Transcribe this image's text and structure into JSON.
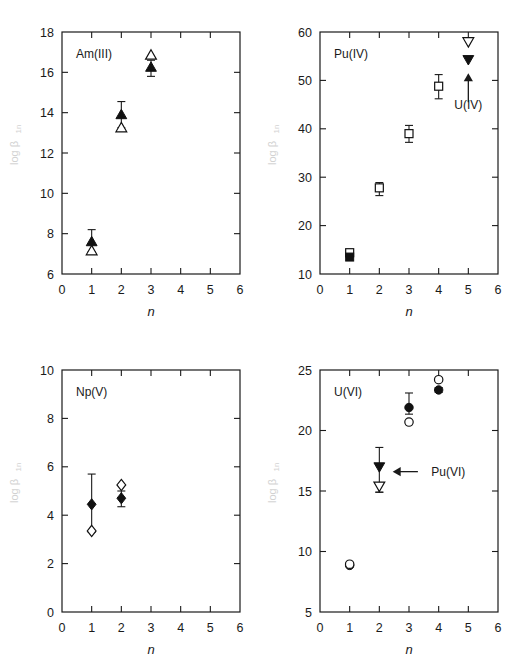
{
  "figure": {
    "cutoff_header": "",
    "axis": {
      "xlabel": "n",
      "ylabel_main": "log",
      "ylabel_beta": "β",
      "ylabel_sub": "1n"
    }
  },
  "chart_data": [
    {
      "type": "scatter",
      "panel": "top-left",
      "title": "Am(III)",
      "xlabel": "n",
      "ylabel": "log β 1n",
      "xlim": [
        0,
        6
      ],
      "ylim": [
        6,
        18
      ],
      "xticks": [
        0,
        1,
        2,
        3,
        4,
        5,
        6
      ],
      "yticks": [
        6,
        8,
        10,
        12,
        14,
        16,
        18
      ],
      "grid": false,
      "legend": "none",
      "series": [
        {
          "name": "filled-triangle-up",
          "marker": "triangle-up-filled",
          "x": [
            1,
            2,
            3
          ],
          "values": [
            7.6,
            13.9,
            16.25
          ],
          "yerr_low": [
            0.5,
            0.65,
            0.45
          ],
          "yerr_high": [
            0.6,
            0.65,
            0.35
          ]
        },
        {
          "name": "open-triangle-up",
          "marker": "triangle-up-open",
          "x": [
            1,
            2,
            3
          ],
          "values": [
            7.15,
            13.25,
            16.85
          ],
          "yerr_low": [
            0,
            0,
            0
          ],
          "yerr_high": [
            0,
            0,
            0
          ]
        }
      ],
      "annotations": []
    },
    {
      "type": "scatter",
      "panel": "top-right",
      "title": "Pu(IV)",
      "xlabel": "n",
      "ylabel": "log β 1n",
      "xlim": [
        0,
        6
      ],
      "ylim": [
        10,
        60
      ],
      "xticks": [
        0,
        1,
        2,
        3,
        4,
        5,
        6
      ],
      "yticks": [
        10,
        20,
        30,
        40,
        50,
        60
      ],
      "grid": false,
      "legend": "none",
      "series": [
        {
          "name": "open-square",
          "marker": "square-open",
          "x": [
            1,
            2,
            3,
            4
          ],
          "values": [
            14.4,
            27.8,
            39.0,
            48.8
          ],
          "yerr_low": [
            0.9,
            1.6,
            1.8,
            2.6
          ],
          "yerr_high": [
            0.6,
            1.1,
            1.7,
            2.4
          ]
        },
        {
          "name": "filled-square",
          "marker": "square-filled",
          "x": [
            1
          ],
          "values": [
            13.5
          ],
          "yerr_low": [
            0
          ],
          "yerr_high": [
            0
          ]
        },
        {
          "name": "open-triangle-down",
          "marker": "triangle-down-open",
          "x": [
            5
          ],
          "values": [
            58.0
          ],
          "yerr_low": [
            0
          ],
          "yerr_high": [
            0
          ]
        },
        {
          "name": "filled-triangle-down",
          "marker": "triangle-down-filled",
          "x": [
            5
          ],
          "values": [
            54.3
          ],
          "yerr_low": [
            0
          ],
          "yerr_high": [
            0
          ]
        }
      ],
      "annotations": [
        {
          "label": "U(IV)",
          "x": 5,
          "y": 45.0,
          "arrow": "up",
          "arrow_from_y": 45.5,
          "arrow_to_y": 51.5
        }
      ]
    },
    {
      "type": "scatter",
      "panel": "bottom-left",
      "title": "Np(V)",
      "xlabel": "n",
      "ylabel": "log β 1n",
      "xlim": [
        0,
        6
      ],
      "ylim": [
        0,
        10
      ],
      "xticks": [
        0,
        1,
        2,
        3,
        4,
        5,
        6
      ],
      "yticks": [
        0,
        2,
        4,
        6,
        8,
        10
      ],
      "grid": false,
      "legend": "none",
      "series": [
        {
          "name": "filled-diamond",
          "marker": "diamond-filled",
          "x": [
            1,
            2
          ],
          "values": [
            4.45,
            4.7
          ],
          "yerr_low": [
            1.15,
            0.35
          ],
          "yerr_high": [
            1.25,
            0.3
          ]
        },
        {
          "name": "open-diamond",
          "marker": "diamond-open",
          "x": [
            1,
            2
          ],
          "values": [
            3.35,
            5.25
          ],
          "yerr_low": [
            0,
            0
          ],
          "yerr_high": [
            0,
            0
          ]
        }
      ],
      "annotations": []
    },
    {
      "type": "scatter",
      "panel": "bottom-right",
      "title": "U(VI)",
      "xlabel": "n",
      "ylabel": "log β 1n",
      "xlim": [
        0,
        6
      ],
      "ylim": [
        5,
        25
      ],
      "xticks": [
        0,
        1,
        2,
        3,
        4,
        5,
        6
      ],
      "yticks": [
        5,
        10,
        15,
        20,
        25
      ],
      "grid": false,
      "legend": "none",
      "series": [
        {
          "name": "filled-circle",
          "marker": "circle-filled",
          "x": [
            1,
            3,
            4
          ],
          "values": [
            8.85,
            21.9,
            23.35
          ],
          "yerr_low": [
            0,
            0.55,
            0.2
          ],
          "yerr_high": [
            0,
            1.2,
            0.2
          ]
        },
        {
          "name": "open-circle",
          "marker": "circle-open",
          "x": [
            1,
            3,
            4
          ],
          "values": [
            8.95,
            20.7,
            24.2
          ],
          "yerr_low": [
            0,
            0,
            0
          ],
          "yerr_high": [
            0,
            0,
            0
          ]
        },
        {
          "name": "filled-triangle-down",
          "marker": "triangle-down-filled",
          "x": [
            2
          ],
          "values": [
            17.0
          ],
          "yerr_low": [
            2.1
          ],
          "yerr_high": [
            1.6
          ]
        },
        {
          "name": "open-triangle-down",
          "marker": "triangle-down-open",
          "x": [
            2
          ],
          "values": [
            15.4
          ],
          "yerr_low": [
            0.5
          ],
          "yerr_high": [
            0
          ]
        }
      ],
      "annotations": [
        {
          "label": "Pu(VI)",
          "x": 3.55,
          "y": 16.6,
          "arrow": "left",
          "arrow_from_x": 3.3,
          "arrow_to_x": 2.45
        }
      ]
    }
  ]
}
